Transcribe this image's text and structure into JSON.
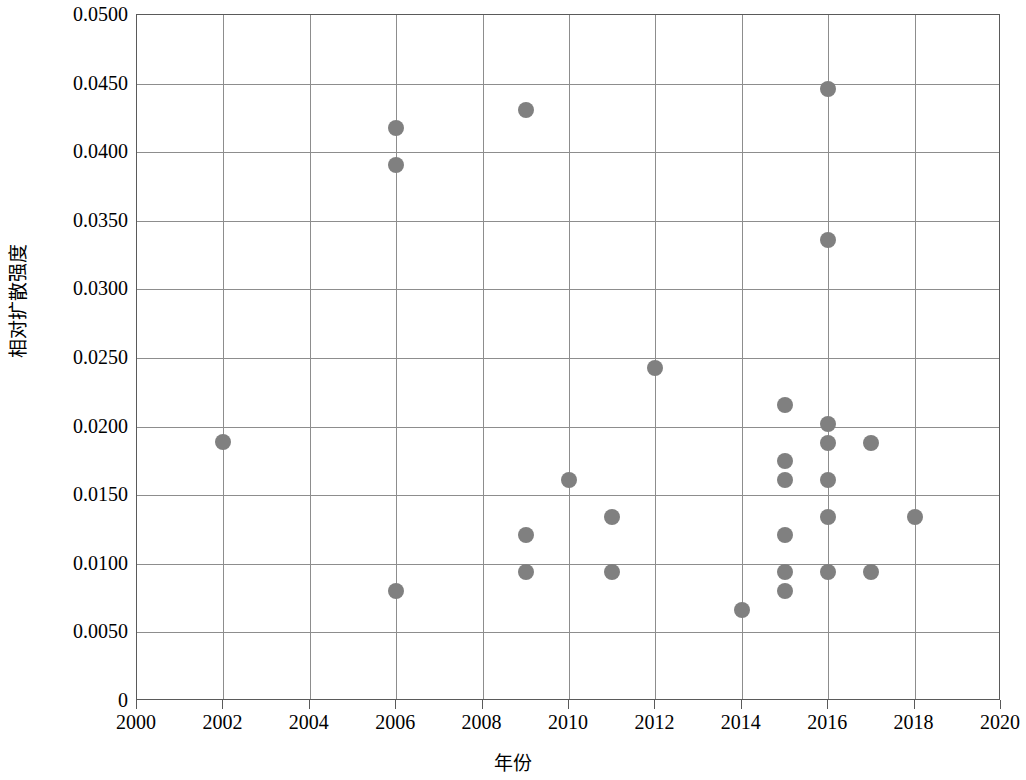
{
  "chart_data": {
    "type": "scatter",
    "title": "",
    "xlabel": "年份",
    "ylabel": "相对扩散强度",
    "xlim": [
      2000,
      2020
    ],
    "ylim": [
      0,
      0.05
    ],
    "grid": true,
    "legend": null,
    "marker_color": "#808080",
    "marker_shape": "circle",
    "x_ticks": [
      2000,
      2002,
      2004,
      2006,
      2008,
      2010,
      2012,
      2014,
      2016,
      2018,
      2020
    ],
    "x_tick_labels": [
      "2000",
      "2002",
      "2004",
      "2006",
      "2008",
      "2010",
      "2012",
      "2014",
      "2016",
      "2018",
      "2020"
    ],
    "y_ticks": [
      0,
      0.005,
      0.01,
      0.015,
      0.02,
      0.025,
      0.03,
      0.035,
      0.04,
      0.045,
      0.05
    ],
    "y_tick_labels": [
      "0",
      "0.0050",
      "0.0100",
      "0.0150",
      "0.0200",
      "0.0250",
      "0.0300",
      "0.0350",
      "0.0400",
      "0.0450",
      "0.0500"
    ],
    "points": [
      {
        "x": 2002,
        "y": 0.0189
      },
      {
        "x": 2006,
        "y": 0.0418
      },
      {
        "x": 2006,
        "y": 0.0391
      },
      {
        "x": 2006,
        "y": 0.008
      },
      {
        "x": 2009,
        "y": 0.0431
      },
      {
        "x": 2009,
        "y": 0.0121
      },
      {
        "x": 2009,
        "y": 0.0094
      },
      {
        "x": 2010,
        "y": 0.0161
      },
      {
        "x": 2011,
        "y": 0.0134
      },
      {
        "x": 2011,
        "y": 0.0094
      },
      {
        "x": 2012,
        "y": 0.0243
      },
      {
        "x": 2014,
        "y": 0.0066
      },
      {
        "x": 2015,
        "y": 0.0216
      },
      {
        "x": 2015,
        "y": 0.0175
      },
      {
        "x": 2015,
        "y": 0.0161
      },
      {
        "x": 2015,
        "y": 0.0121
      },
      {
        "x": 2015,
        "y": 0.0094
      },
      {
        "x": 2015,
        "y": 0.008
      },
      {
        "x": 2016,
        "y": 0.0446
      },
      {
        "x": 2016,
        "y": 0.0336
      },
      {
        "x": 2016,
        "y": 0.0202
      },
      {
        "x": 2016,
        "y": 0.0188
      },
      {
        "x": 2016,
        "y": 0.0161
      },
      {
        "x": 2016,
        "y": 0.0134
      },
      {
        "x": 2016,
        "y": 0.0094
      },
      {
        "x": 2017,
        "y": 0.0188
      },
      {
        "x": 2017,
        "y": 0.0094
      },
      {
        "x": 2018,
        "y": 0.0134
      }
    ]
  }
}
